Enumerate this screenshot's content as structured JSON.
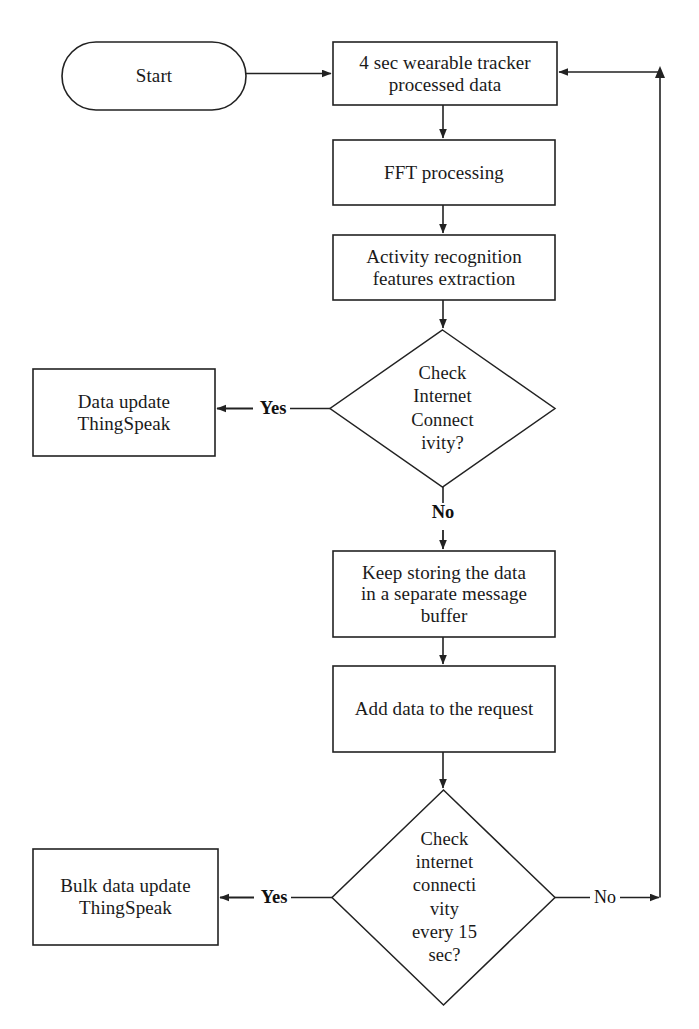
{
  "diagram": {
    "kind": "flowchart",
    "stroke_color": "#222222",
    "background_color": "#ffffff",
    "text_color": "#1a1a1a"
  },
  "nodes": {
    "start": {
      "shape": "terminator",
      "label": "Start",
      "x": 62,
      "y": 42,
      "w": 184,
      "h": 68
    },
    "wearable_data": {
      "shape": "process",
      "label": "4 sec wearable tracker\nprocessed data",
      "x": 333,
      "y": 42,
      "w": 224,
      "h": 63
    },
    "fft": {
      "shape": "process",
      "label": "FFT processing",
      "x": 333,
      "y": 140,
      "w": 222,
      "h": 65
    },
    "activity": {
      "shape": "process",
      "label": "Activity recognition\nfeatures extraction",
      "x": 333,
      "y": 235,
      "w": 222,
      "h": 65
    },
    "check_internet_1": {
      "shape": "decision",
      "label": "Check\nInternet\nConnect\nivity?",
      "x": 330,
      "y": 330,
      "w": 225,
      "h": 157
    },
    "data_update": {
      "shape": "process",
      "label": "Data update\nThingSpeak",
      "x": 33,
      "y": 369,
      "w": 182,
      "h": 87
    },
    "keep_storing": {
      "shape": "process",
      "label": "Keep storing the data\nin a separate message\nbuffer",
      "x": 333,
      "y": 551,
      "w": 222,
      "h": 86
    },
    "add_data": {
      "shape": "process",
      "label": "Add data to the request",
      "x": 333,
      "y": 666,
      "w": 222,
      "h": 86
    },
    "check_internet_2": {
      "shape": "decision",
      "label": "Check\ninternet\nconnecti\nvity\nevery 15\nsec?",
      "x": 332,
      "y": 790,
      "w": 223,
      "h": 215
    },
    "bulk_update": {
      "shape": "process",
      "label": "Bulk data update\nThingSpeak",
      "x": 33,
      "y": 849,
      "w": 185,
      "h": 96
    }
  },
  "edges": [
    {
      "id": "start-to-wearable",
      "from": "start",
      "to": "wearable_data",
      "label": ""
    },
    {
      "id": "wearable-to-fft",
      "from": "wearable_data",
      "to": "fft",
      "label": ""
    },
    {
      "id": "fft-to-activity",
      "from": "fft",
      "to": "activity",
      "label": ""
    },
    {
      "id": "activity-to-check1",
      "from": "activity",
      "to": "check_internet_1",
      "label": ""
    },
    {
      "id": "check1-yes",
      "from": "check_internet_1",
      "to": "data_update",
      "label": "Yes",
      "bold": true
    },
    {
      "id": "check1-no",
      "from": "check_internet_1",
      "to": "keep_storing",
      "label": "No",
      "bold": true
    },
    {
      "id": "keep-to-add",
      "from": "keep_storing",
      "to": "add_data",
      "label": ""
    },
    {
      "id": "add-to-check2",
      "from": "add_data",
      "to": "check_internet_2",
      "label": ""
    },
    {
      "id": "check2-yes",
      "from": "check_internet_2",
      "to": "bulk_update",
      "label": "Yes",
      "bold": true
    },
    {
      "id": "check2-no-feedback",
      "from": "check_internet_2",
      "to": "wearable_data",
      "label": "No",
      "bold": false
    }
  ],
  "edge_labels": {
    "yes_top": "Yes",
    "no_top": "No",
    "yes_bottom": "Yes",
    "no_bottom": "No"
  }
}
